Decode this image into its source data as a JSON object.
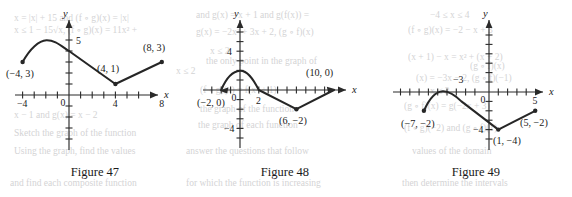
{
  "page": {
    "background_color": "#ffffff",
    "ink_color": "#262626",
    "ghost_text_color": "#b9b9bb"
  },
  "ghost_text": [
    {
      "text": "x = |x| + 15 and  (f ∘ g)(x) = |x|",
      "x": 14,
      "y": 12
    },
    {
      "text": "and g(x) = x + 1 and  g(f(x)) =",
      "x": 196,
      "y": 10
    },
    {
      "text": "−4 ≤ x ≤ 4",
      "x": 430,
      "y": 10
    },
    {
      "text": "x ≤ 1 − 15√x,  (f ∘ g)(x) = 11x² +",
      "x": 14,
      "y": 24
    },
    {
      "text": "g(x) = −2x² + 3x + 2,  (g ∘ f)(x)",
      "x": 196,
      "y": 26
    },
    {
      "text": "(f ∘ g)(x) = −2 − x + 3",
      "x": 408,
      "y": 24
    },
    {
      "text": "x ≤ 2",
      "x": 210,
      "y": 46
    },
    {
      "text": "the only point in the graph of",
      "x": 206,
      "y": 56
    },
    {
      "text": "(x + 1) − x = x² + (x + 2)",
      "x": 408,
      "y": 52
    },
    {
      "text": "x ≤ 2",
      "x": 176,
      "y": 66
    },
    {
      "text": "(x) = −3x − 2, (g ∘ f)(−1)",
      "x": 416,
      "y": 72
    },
    {
      "text": "(f ∘ g)(x) = f(x² + 1)",
      "x": 200,
      "y": 84
    },
    {
      "text": "the graph of the function",
      "x": 200,
      "y": 104
    },
    {
      "text": "(g ∘ f)(x) = g(−2x + 3)",
      "x": 404,
      "y": 100
    },
    {
      "text": "x − 1 and  g(x) = x − 2",
      "x": 14,
      "y": 110
    },
    {
      "text": "the graph of each function",
      "x": 198,
      "y": 120
    },
    {
      "text": "(f ∘ g)(−2) and  (g ∘ f)(1)",
      "x": 404,
      "y": 122
    },
    {
      "text": "Sketch the graph of the function",
      "x": 14,
      "y": 128
    },
    {
      "text": "values of the domain",
      "x": 412,
      "y": 146
    },
    {
      "text": "Using the graph, find the values",
      "x": 14,
      "y": 146
    },
    {
      "text": "answer the questions that follow",
      "x": 186,
      "y": 146
    },
    {
      "text": "and find each composite function",
      "x": 10,
      "y": 178
    },
    {
      "text": "for which the function is increasing",
      "x": 186,
      "y": 178
    },
    {
      "text": "then determine the intervals",
      "x": 402,
      "y": 178
    },
    {
      "text": "(g ∘ f)(x)",
      "x": 470,
      "y": 60
    },
    {
      "text": "x ≤ 3",
      "x": 430,
      "y": 86
    }
  ],
  "figures": [
    {
      "id": "figure-47",
      "caption": "Figure 47",
      "x_axis_label": "x",
      "y_axis_label": "y",
      "x_tick_labels": [
        {
          "text": "−4",
          "value": -4
        },
        {
          "text": "0",
          "value": 0
        },
        {
          "text": "4",
          "value": 4
        },
        {
          "text": "8",
          "value": 8
        }
      ],
      "y_tick_labels": [
        {
          "text": "5",
          "value": 5
        }
      ],
      "point_labels": [
        {
          "text": "(−4, 3)",
          "point": [
            -4,
            3
          ]
        },
        {
          "text": "(4, 1)",
          "point": [
            4,
            1
          ]
        },
        {
          "text": "(8, 3)",
          "point": [
            8,
            3
          ]
        }
      ],
      "endpoints": [
        [
          -4,
          3
        ],
        [
          8,
          3
        ]
      ],
      "vertices": [
        [
          4,
          1
        ]
      ],
      "x_range": [
        -5,
        10
      ],
      "y_range": [
        -5,
        7
      ],
      "description": "Smooth arch from (−4,3) peaking near (−2,5) down to (0,4), then straight segment to (4,1), then straight segment up to (8,3)."
    },
    {
      "id": "figure-48",
      "caption": "Figure 48",
      "x_axis_label": "x",
      "y_axis_label": "y",
      "x_tick_labels": [
        {
          "text": "0",
          "value": 0
        },
        {
          "text": "2",
          "value": 2
        }
      ],
      "y_tick_labels": [
        {
          "text": "4",
          "value": 4
        },
        {
          "text": "−4",
          "value": -4
        }
      ],
      "point_labels": [
        {
          "text": "(−2, 0)",
          "point": [
            -2,
            0
          ]
        },
        {
          "text": "(6, −2)",
          "point": [
            6,
            -2
          ]
        },
        {
          "text": "(10, 0)",
          "point": [
            10,
            0
          ]
        }
      ],
      "endpoints": [
        [
          -2,
          0
        ],
        [
          10,
          0
        ]
      ],
      "vertices": [
        [
          6,
          -2
        ]
      ],
      "x_range": [
        -3,
        12
      ],
      "y_range": [
        -6,
        6
      ],
      "description": "Arch from (−2,0) peaking near (0,2) back down to (2,0), then straight segment to (6,−2), then straight segment up to (10,0)."
    },
    {
      "id": "figure-49",
      "caption": "Figure 49",
      "x_axis_label": "x",
      "y_axis_label": "y",
      "x_tick_labels": [
        {
          "text": "−3",
          "value": -3
        },
        {
          "text": "0",
          "value": 0
        },
        {
          "text": "5",
          "value": 5
        }
      ],
      "y_tick_labels": [
        {
          "text": "−4",
          "value": -4
        }
      ],
      "point_labels": [
        {
          "text": "(−7, −2)",
          "point": [
            -7,
            -2
          ]
        },
        {
          "text": "(1, −4)",
          "point": [
            1,
            -4
          ]
        },
        {
          "text": "(5, −2)",
          "point": [
            5,
            -2
          ]
        }
      ],
      "endpoints": [
        [
          -7,
          -2
        ],
        [
          5,
          -2
        ]
      ],
      "vertices": [
        [
          1,
          -4
        ]
      ],
      "x_range": [
        -8,
        7
      ],
      "y_range": [
        -6,
        6
      ],
      "description": "Arch from (−7,−2) peaking near (−5,0) down to (−3,−1), then straight segment to (1,−4), then straight segment up to (5,−2)."
    }
  ],
  "chart_data": [
    {
      "type": "line",
      "title": "Figure 47",
      "xlabel": "x",
      "ylabel": "y",
      "xlim": [
        -5,
        10
      ],
      "ylim": [
        -5,
        7
      ],
      "grid": false,
      "xticks": [
        -4,
        0,
        4,
        8
      ],
      "yticks": [
        5
      ],
      "annotations": [
        "(−4, 3)",
        "(4, 1)",
        "(8, 3)"
      ],
      "series": [
        {
          "name": "piecewise curve",
          "points": [
            [
              -4,
              3
            ],
            [
              -3.4,
              4.1
            ],
            [
              -2.8,
              4.75
            ],
            [
              -2.2,
              4.95
            ],
            [
              -1.6,
              4.8
            ],
            [
              -1.0,
              4.45
            ],
            [
              -0.5,
              4.2
            ],
            [
              0,
              4
            ],
            [
              4,
              1
            ],
            [
              8,
              3
            ]
          ]
        }
      ]
    },
    {
      "type": "line",
      "title": "Figure 48",
      "xlabel": "x",
      "ylabel": "y",
      "xlim": [
        -3,
        12
      ],
      "ylim": [
        -6,
        6
      ],
      "grid": false,
      "xticks": [
        0,
        2
      ],
      "yticks": [
        4,
        -4
      ],
      "annotations": [
        "(−2, 0)",
        "(6, −2)",
        "(10, 0)"
      ],
      "series": [
        {
          "name": "piecewise curve",
          "points": [
            [
              -2,
              0
            ],
            [
              -1.5,
              1.1
            ],
            [
              -1.0,
              1.7
            ],
            [
              -0.5,
              1.95
            ],
            [
              0,
              2
            ],
            [
              0.5,
              1.85
            ],
            [
              1.0,
              1.45
            ],
            [
              1.5,
              0.85
            ],
            [
              2,
              0
            ],
            [
              6,
              -2
            ],
            [
              10,
              0
            ]
          ]
        }
      ]
    },
    {
      "type": "line",
      "title": "Figure 49",
      "xlabel": "x",
      "ylabel": "y",
      "xlim": [
        -8,
        7
      ],
      "ylim": [
        -6,
        6
      ],
      "grid": false,
      "xticks": [
        -3,
        0,
        5
      ],
      "yticks": [
        -4
      ],
      "annotations": [
        "(−7, −2)",
        "(1, −4)",
        "(5, −2)"
      ],
      "series": [
        {
          "name": "piecewise curve",
          "points": [
            [
              -7,
              -2
            ],
            [
              -6.4,
              -1.1
            ],
            [
              -5.8,
              -0.5
            ],
            [
              -5.2,
              -0.25
            ],
            [
              -4.6,
              -0.35
            ],
            [
              -4.0,
              -0.7
            ],
            [
              -3.5,
              -0.92
            ],
            [
              -3,
              -1
            ],
            [
              1,
              -4
            ],
            [
              5,
              -2
            ]
          ]
        }
      ]
    }
  ]
}
